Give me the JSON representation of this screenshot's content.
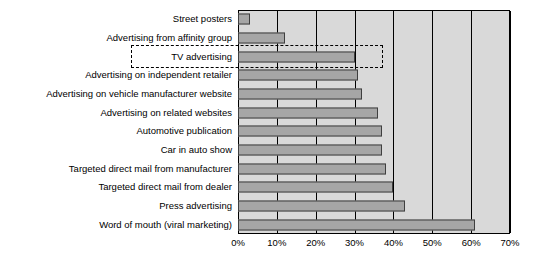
{
  "chart_data": {
    "type": "bar",
    "orientation": "horizontal",
    "title": "",
    "xlabel": "",
    "ylabel": "",
    "xlim": [
      0,
      70
    ],
    "xtick_labels": [
      "0%",
      "10%",
      "20%",
      "30%",
      "40%",
      "50%",
      "60%",
      "70%"
    ],
    "xticks": [
      0,
      10,
      20,
      30,
      40,
      50,
      60,
      70
    ],
    "grid": true,
    "legend": "none",
    "categories": [
      "Street posters",
      "Advertising from affinity group",
      "TV advertising",
      "Advertising on independent retailer",
      "Advertising on vehicle manufacturer website",
      "Advertising on related websites",
      "Automotive publication",
      "Car in auto show",
      "Targeted direct mail from manufacturer",
      "Targeted direct mail from dealer",
      "Press advertising",
      "Word of mouth (viral marketing)"
    ],
    "values": [
      3,
      12,
      30,
      31,
      32,
      36,
      37,
      37,
      38,
      40,
      43,
      61
    ],
    "annotations": [
      {
        "name": "tv-advertising-highlight",
        "type": "dashed-rectangle",
        "target_category": "TV advertising"
      }
    ],
    "colors": {
      "plot_background": "#d9d9d9",
      "bar_fill": "#a6a6a6",
      "bar_border": "#3f3f3f",
      "gridline": "#000000",
      "text": "#000000"
    }
  }
}
